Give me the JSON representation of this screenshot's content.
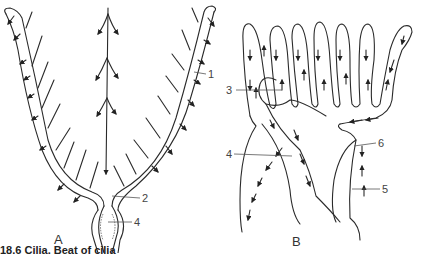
{
  "figure": {
    "panels": [
      {
        "id": "A",
        "label": "A",
        "callouts": [
          {
            "number": "1"
          },
          {
            "number": "2"
          },
          {
            "number": "4"
          }
        ]
      },
      {
        "id": "B",
        "label": "B",
        "callouts": [
          {
            "number": "3"
          },
          {
            "number": "4"
          },
          {
            "number": "5"
          },
          {
            "number": "6"
          }
        ]
      }
    ],
    "caption": "18.6 Cilia. Beat of cilia"
  }
}
